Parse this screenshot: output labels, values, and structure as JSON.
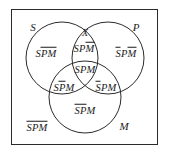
{
  "figure": {
    "type": "venn-diagram-3-set",
    "frame": {
      "border_color": "#2b2b2b"
    },
    "stroke_color": "#2b2b2b",
    "background": "#ffffff"
  },
  "set_labels": {
    "s": "S",
    "p": "P",
    "m": "M"
  },
  "point_labels": {
    "x": "X"
  },
  "regions": {
    "s_only": {
      "plain_head": "S",
      "overlined_tail": "PM"
    },
    "sp_not_m": {
      "plain_head": "SP",
      "overlined_tail": "M"
    },
    "p_only": {
      "overlined_head": "S",
      "plain_mid": "P",
      "overlined_tail": "M"
    },
    "spm_center": {
      "plain": "SPM"
    },
    "sm_not_p": {
      "plain_head": "S",
      "overlined_mid": "P",
      "plain_tail": "M"
    },
    "pm_not_s": {
      "overlined_head": "S",
      "plain_tail": "PM"
    },
    "m_only": {
      "overlined_head": "SP",
      "plain_tail": "M"
    },
    "outside": {
      "overlined": "SPM"
    }
  }
}
